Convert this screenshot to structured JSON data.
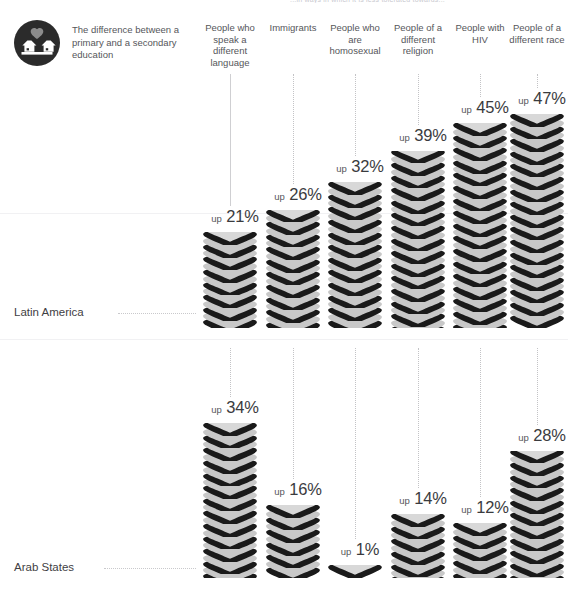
{
  "top_caption": "...in ways in which it is less tolerated towards...",
  "legend": {
    "icon": "houses-heart-circle-icon",
    "text": "The difference between a primary and a secondary education",
    "icon_colors": {
      "circle": "#2b2b2b",
      "house": "#ffffff",
      "heart": "#8c8c8c"
    }
  },
  "palette": {
    "disc_top": "#c8c8c8",
    "disc_top_light": "#d8d8d8",
    "disc_shadow": "#1a1a1a",
    "disc_side": "#b4b4b4",
    "guide": "#c3c3c6",
    "text": "#4a4a4a"
  },
  "columns": [
    {
      "label": "People who speak a different language"
    },
    {
      "label": "Immigrants"
    },
    {
      "label": "People who are homosexual"
    },
    {
      "label": "People of a different religion"
    },
    {
      "label": "People with HIV"
    },
    {
      "label": "People of a different race"
    }
  ],
  "rows": [
    {
      "label": "Latin America"
    },
    {
      "label": "Arab States"
    }
  ],
  "value_prefix": "up",
  "value_suffix": "%",
  "chart_data": {
    "type": "bar",
    "title": "The difference between a primary and a secondary education",
    "xlabel": "",
    "ylabel": "Percentage-point increase in tolerance",
    "categories": [
      "People who speak a different language",
      "Immigrants",
      "People who are homosexual",
      "People of a different religion",
      "People with HIV",
      "People of a different race"
    ],
    "series": [
      {
        "name": "Latin America",
        "values": [
          21,
          26,
          32,
          39,
          45,
          47
        ]
      },
      {
        "name": "Arab States",
        "values": [
          34,
          16,
          1,
          14,
          12,
          28
        ]
      }
    ],
    "value_labels": [
      [
        "up 21%",
        "up 26%",
        "up 32%",
        "up 39%",
        "up 45%",
        "up 47%"
      ],
      [
        "up 34%",
        "up 16%",
        "up 1%",
        "up 14%",
        "up 12%",
        "up 28%"
      ]
    ],
    "ylim": [
      0,
      47
    ],
    "grid": false,
    "legend_position": "left-row-labels",
    "units": "percent",
    "glyph": "heart-stack"
  }
}
